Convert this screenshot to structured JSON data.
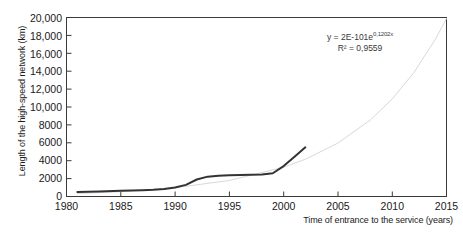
{
  "chart_data": {
    "type": "line",
    "title": "",
    "xlabel": "Time of entrance to the service (years)",
    "ylabel": "Length of the high-speed network (km)",
    "xlim": [
      1980,
      2015
    ],
    "ylim": [
      0,
      20000
    ],
    "xticks": [
      1980,
      1985,
      1990,
      1995,
      2000,
      2005,
      2010,
      2015
    ],
    "xtick_labels": [
      "1980",
      "1985",
      "1990",
      "1995",
      "2000",
      "2005",
      "2010",
      "2015"
    ],
    "yticks": [
      0,
      2000,
      4000,
      6000,
      8000,
      10000,
      12000,
      14000,
      16000,
      18000,
      20000
    ],
    "ytick_labels": [
      "0",
      "2000",
      "4000",
      "6000",
      "8000",
      "10,000",
      "12,000",
      "14,000",
      "16,000",
      "18,000",
      "20,000"
    ],
    "grid": false,
    "legend": null,
    "series": [
      {
        "name": "High-speed network length",
        "type": "line",
        "color": "#333333",
        "width": 2.0,
        "x": [
          1981,
          1983,
          1985,
          1987,
          1988,
          1989,
          1990,
          1991,
          1992,
          1993,
          1994,
          1995,
          1996,
          1997,
          1998,
          1999,
          2000,
          2001,
          2002
        ],
        "values": [
          500,
          560,
          640,
          710,
          760,
          850,
          1000,
          1300,
          1900,
          2220,
          2330,
          2380,
          2400,
          2420,
          2450,
          2600,
          3400,
          4450,
          5500
        ]
      },
      {
        "name": "Exponential trendline",
        "type": "line",
        "color": "#d8d8d8",
        "width": 1.0,
        "dash": "none",
        "x": [
          1981,
          1985,
          1990,
          1995,
          2000,
          2002,
          2005,
          2008,
          2010,
          2012,
          2014,
          2015
        ],
        "values": [
          330,
          540,
          980,
          1790,
          3270,
          4160,
          5970,
          8560,
          10890,
          13850,
          17620,
          19880
        ]
      }
    ],
    "annotations": [
      {
        "name": "trendline-equation",
        "equation_prefix": "y = 2E-101e",
        "equation_exponent": "0,1202x",
        "r_squared": "R² = 0,9559",
        "x": 2006,
        "y": 17200
      }
    ]
  },
  "axis": {
    "frame_color": "#3a3a3a",
    "tick_color": "#3a3a3a"
  }
}
